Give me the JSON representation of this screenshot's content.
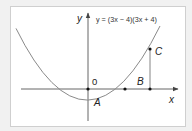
{
  "diagram": {
    "equation": "y = (3x − 4)(3x + 4)",
    "axis_labels": {
      "x": "x",
      "y": "y"
    },
    "origin_label": "0",
    "point_labels": {
      "A": "A",
      "B": "B",
      "C": "C"
    },
    "colors": {
      "background": "#f1f1f1",
      "panel": "#ffffff",
      "frame": "#cfcfcf",
      "curve": "#8a8a8a",
      "axes": "#555555",
      "points": "#111111",
      "text": "#222222"
    }
  }
}
